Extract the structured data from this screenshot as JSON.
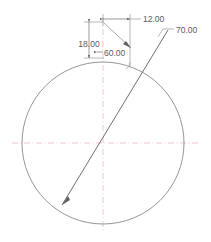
{
  "drawing": {
    "title": "circle-with-chord-dimensioned-sketch",
    "colors": {
      "geometry": "#7a7a7a",
      "construction": "#9a9a9a",
      "dimension": "#808080",
      "centerline": "#e8b4c8",
      "text": "#5a5a5a",
      "background": "#ffffff"
    },
    "circle": {
      "center_x": 103,
      "center_y": 143,
      "radius": 81
    },
    "chord_line": {
      "x1": 62,
      "y1": 205,
      "x2": 168,
      "y2": 30
    },
    "centerlines": {
      "horizontal_y": 143,
      "vertical_x": 103
    },
    "dimensions": [
      {
        "id": "dim-12",
        "label": "12.00",
        "kind": "linear-horizontal",
        "text_x": 137,
        "text_y": 21
      },
      {
        "id": "dim-18",
        "label": "18.00",
        "kind": "linear-vertical",
        "text_x": 71,
        "text_y": 44
      },
      {
        "id": "dim-60",
        "label": "60.00",
        "kind": "angular-leader",
        "text_x": 104,
        "text_y": 54
      },
      {
        "id": "dim-70",
        "label": "70.00",
        "kind": "leader",
        "text_x": 176,
        "text_y": 34
      }
    ]
  }
}
